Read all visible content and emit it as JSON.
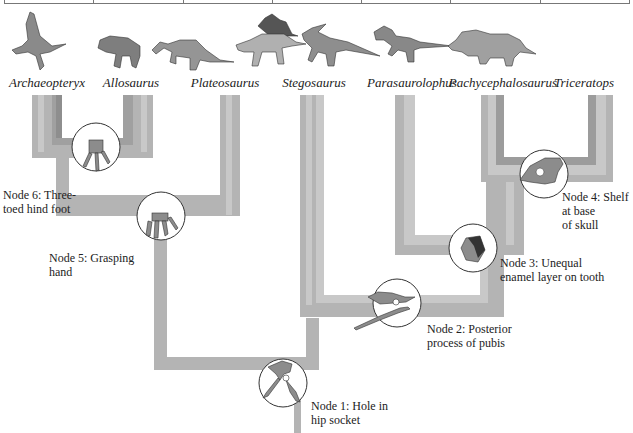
{
  "taxa": [
    {
      "name": "Archaeopteryx",
      "x": 47
    },
    {
      "name": "Allosaurus",
      "x": 131
    },
    {
      "name": "Plateosaurus",
      "x": 225
    },
    {
      "name": "Stegosaurus",
      "x": 314
    },
    {
      "name": "Parasaurolophus",
      "x": 412
    },
    {
      "name": "Pachycephalosaurus",
      "x": 503
    },
    {
      "name": "Triceratops",
      "x": 584
    }
  ],
  "nodes": [
    {
      "id": 1,
      "line1": "Node 1: Hole in",
      "line2": "hip socket",
      "icon": "hip-socket-bone-icon"
    },
    {
      "id": 2,
      "line1": "Node 2: Posterior",
      "line2": "process of pubis",
      "icon": "pubis-bone-icon"
    },
    {
      "id": 3,
      "line1": "Node 3: Unequal",
      "line2": "enamel layer on tooth",
      "icon": "tooth-icon"
    },
    {
      "id": 4,
      "line1": "Node 4: Shelf",
      "line2": "at base",
      "line3": "of skull",
      "icon": "skull-icon"
    },
    {
      "id": 5,
      "line1": "Node 5: Grasping",
      "line2": "hand",
      "icon": "grasping-hand-icon"
    },
    {
      "id": 6,
      "line1": "Node 6: Three-",
      "line2": "toed hind foot",
      "icon": "three-toed-foot-icon"
    }
  ],
  "colors": {
    "branch_outer": "#b4b4b4",
    "branch_mid": "#c8c8c8",
    "branch_dark": "#9a9a9a",
    "circle_fill": "#ffffff",
    "circle_stroke": "#333333",
    "bone_fill": "#8c8c8c"
  }
}
